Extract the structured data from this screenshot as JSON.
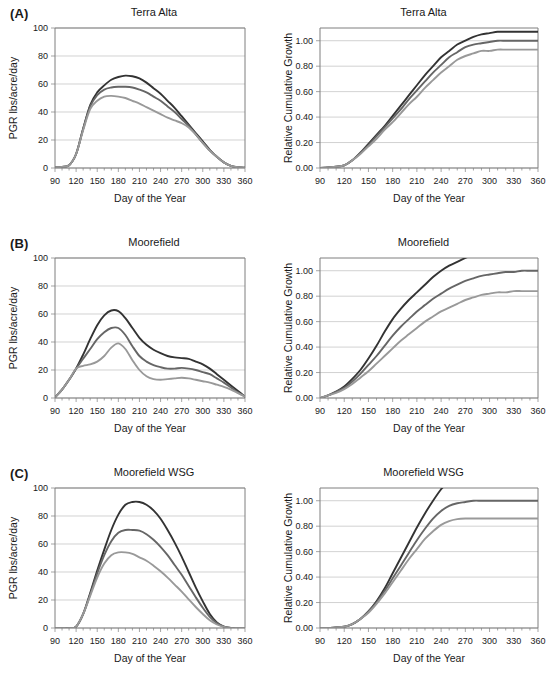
{
  "figure": {
    "panels": [
      {
        "tag": "(A)",
        "location": "Terra Alta",
        "left_title": "Terra Alta",
        "right_title": "Terra Alta"
      },
      {
        "tag": "(B)",
        "location": "Moorefield",
        "left_title": "Moorefield",
        "right_title": "Moorefield"
      },
      {
        "tag": "(C)",
        "location": "Moorefield WSG",
        "left_title": "Moorefield WSG",
        "right_title": "Moorefield WSG"
      }
    ]
  },
  "axes": {
    "x_label": "Day of the Year",
    "x_ticks": [
      90,
      120,
      150,
      180,
      210,
      240,
      270,
      300,
      330,
      360
    ],
    "x_range": [
      90,
      360
    ],
    "pgr_label": "PGR lbs/acre/day",
    "pgr_ticks": [
      0,
      20,
      40,
      60,
      80,
      100
    ],
    "pgr_range": [
      0,
      100
    ],
    "rcg_label": "Relative Cumulative Growth",
    "rcg_ticks": [
      "0.00",
      "0.20",
      "0.40",
      "0.60",
      "0.80",
      "1.00"
    ],
    "rcg_tick_values": [
      0,
      0.2,
      0.4,
      0.6,
      0.8,
      1.0
    ],
    "rcg_range": [
      0,
      1.1
    ]
  },
  "colors": {
    "series_dark": "#333333",
    "series_medium": "#666666",
    "series_light": "#999999",
    "axis": "#7f7f7f",
    "grid": "#bfbfbf",
    "text": "#1a1a1a",
    "background": "#ffffff"
  },
  "chart_data": [
    {
      "id": "a-left",
      "type": "line",
      "title": "Terra Alta",
      "xlabel": "Day of the Year",
      "ylabel": "PGR lbs/acre/day",
      "xlim": [
        90,
        360
      ],
      "ylim": [
        0,
        100
      ],
      "grid": true,
      "legend": "none",
      "x": [
        90,
        100,
        110,
        120,
        130,
        140,
        150,
        160,
        170,
        180,
        190,
        200,
        210,
        220,
        230,
        240,
        250,
        260,
        270,
        280,
        290,
        300,
        310,
        320,
        330,
        340,
        350,
        360
      ],
      "series": [
        {
          "name": "high",
          "color": "#333333",
          "values": [
            0.5,
            0.8,
            2,
            10,
            28,
            45,
            54,
            59,
            63,
            65,
            66,
            65.5,
            64,
            61,
            57,
            53,
            48,
            43,
            37,
            31,
            25,
            19,
            13,
            8,
            4,
            1.5,
            0.5,
            0.2
          ]
        },
        {
          "name": "medium",
          "color": "#666666",
          "values": [
            0.5,
            0.8,
            2,
            10,
            28,
            44,
            52,
            56,
            57.5,
            58,
            58,
            57.5,
            56,
            54,
            51,
            48,
            44,
            40,
            35,
            30,
            24,
            18,
            12.5,
            8,
            4,
            1.5,
            0.5,
            0.2
          ]
        },
        {
          "name": "low",
          "color": "#999999",
          "values": [
            0.5,
            0.8,
            2,
            10,
            27,
            42,
            48,
            51,
            51.5,
            51,
            50,
            48,
            46,
            43.5,
            41,
            38.5,
            36,
            34,
            32,
            29,
            24,
            18,
            12.5,
            8,
            4,
            1.5,
            0.5,
            0.2
          ]
        }
      ]
    },
    {
      "id": "a-right",
      "type": "line",
      "title": "Terra Alta",
      "xlabel": "Day of the Year",
      "ylabel": "Relative Cumulative Growth",
      "xlim": [
        90,
        360
      ],
      "ylim": [
        0,
        1.1
      ],
      "grid": true,
      "legend": "none",
      "x": [
        90,
        100,
        110,
        120,
        130,
        140,
        150,
        160,
        170,
        180,
        190,
        200,
        210,
        220,
        230,
        240,
        250,
        260,
        270,
        280,
        290,
        300,
        310,
        320,
        330,
        340,
        350,
        360
      ],
      "series": [
        {
          "name": "high",
          "color": "#333333",
          "values": [
            0.0,
            0.005,
            0.01,
            0.02,
            0.06,
            0.12,
            0.19,
            0.26,
            0.33,
            0.41,
            0.49,
            0.57,
            0.65,
            0.73,
            0.8,
            0.87,
            0.92,
            0.97,
            1.0,
            1.03,
            1.05,
            1.06,
            1.07,
            1.07,
            1.07,
            1.07,
            1.07,
            1.07
          ]
        },
        {
          "name": "medium",
          "color": "#666666",
          "values": [
            0.0,
            0.005,
            0.01,
            0.02,
            0.06,
            0.12,
            0.18,
            0.25,
            0.32,
            0.39,
            0.46,
            0.54,
            0.61,
            0.68,
            0.75,
            0.81,
            0.87,
            0.91,
            0.95,
            0.97,
            0.98,
            0.99,
            1.0,
            1.0,
            1.0,
            1.0,
            1.0,
            1.0
          ]
        },
        {
          "name": "low",
          "color": "#999999",
          "values": [
            0.0,
            0.005,
            0.01,
            0.02,
            0.06,
            0.11,
            0.17,
            0.23,
            0.3,
            0.36,
            0.43,
            0.5,
            0.56,
            0.63,
            0.69,
            0.75,
            0.8,
            0.85,
            0.88,
            0.9,
            0.92,
            0.92,
            0.93,
            0.93,
            0.93,
            0.93,
            0.93,
            0.93
          ]
        }
      ]
    },
    {
      "id": "b-left",
      "type": "line",
      "title": "Moorefield",
      "xlabel": "Day of the Year",
      "ylabel": "PGR lbs/acre/day",
      "xlim": [
        90,
        360
      ],
      "ylim": [
        0,
        100
      ],
      "grid": true,
      "legend": "none",
      "x": [
        90,
        100,
        110,
        120,
        130,
        140,
        150,
        160,
        170,
        180,
        190,
        200,
        210,
        220,
        230,
        240,
        250,
        260,
        270,
        280,
        290,
        300,
        310,
        320,
        330,
        340,
        350,
        360
      ],
      "series": [
        {
          "name": "high",
          "color": "#333333",
          "values": [
            0.5,
            6,
            13,
            21,
            31,
            42,
            52,
            59,
            62.5,
            62,
            57,
            50,
            43,
            38,
            34.5,
            32,
            30,
            29,
            28.5,
            28,
            26,
            24,
            21,
            17,
            13,
            9,
            5,
            1
          ]
        },
        {
          "name": "medium",
          "color": "#666666",
          "values": [
            0.5,
            6,
            13,
            21,
            28,
            35,
            42,
            47,
            50,
            50,
            45,
            37,
            30,
            26,
            23.5,
            22,
            21,
            21,
            21.5,
            21,
            20,
            18.5,
            17,
            14,
            11,
            7.5,
            4,
            1
          ]
        },
        {
          "name": "low",
          "color": "#999999",
          "values": [
            0.5,
            6,
            13,
            21,
            23,
            24,
            26,
            30,
            36,
            39,
            35,
            27,
            20,
            15.5,
            13.5,
            13,
            13.5,
            14,
            14.5,
            14,
            13,
            12,
            11,
            9.5,
            8,
            6,
            3.5,
            1
          ]
        }
      ]
    },
    {
      "id": "b-right",
      "type": "line",
      "title": "Moorefield",
      "xlabel": "Day of the Year",
      "ylabel": "Relative Cumulative Growth",
      "xlim": [
        90,
        360
      ],
      "ylim": [
        0,
        1.1
      ],
      "grid": true,
      "legend": "none",
      "x": [
        90,
        100,
        110,
        120,
        130,
        140,
        150,
        160,
        170,
        180,
        190,
        200,
        210,
        220,
        230,
        240,
        250,
        260,
        270,
        280,
        290,
        300,
        310,
        320,
        330,
        340,
        350,
        360
      ],
      "series": [
        {
          "name": "high",
          "color": "#333333",
          "values": [
            0.0,
            0.02,
            0.05,
            0.09,
            0.15,
            0.22,
            0.31,
            0.41,
            0.52,
            0.62,
            0.7,
            0.77,
            0.83,
            0.89,
            0.95,
            1.0,
            1.04,
            1.07,
            1.1,
            1.13,
            1.16,
            1.18,
            1.19,
            1.2,
            1.2,
            1.2,
            1.2,
            1.2
          ]
        },
        {
          "name": "medium",
          "color": "#666666",
          "values": [
            0.0,
            0.02,
            0.05,
            0.08,
            0.13,
            0.19,
            0.26,
            0.33,
            0.41,
            0.49,
            0.56,
            0.62,
            0.68,
            0.73,
            0.78,
            0.82,
            0.86,
            0.89,
            0.92,
            0.94,
            0.96,
            0.97,
            0.98,
            0.99,
            0.99,
            1.0,
            1.0,
            1.0
          ]
        },
        {
          "name": "low",
          "color": "#999999",
          "values": [
            0.0,
            0.02,
            0.04,
            0.07,
            0.11,
            0.16,
            0.21,
            0.27,
            0.33,
            0.39,
            0.45,
            0.5,
            0.55,
            0.6,
            0.64,
            0.68,
            0.71,
            0.74,
            0.77,
            0.79,
            0.81,
            0.82,
            0.83,
            0.83,
            0.84,
            0.84,
            0.84,
            0.84
          ]
        }
      ]
    },
    {
      "id": "c-left",
      "type": "line",
      "title": "Moorefield WSG",
      "xlabel": "Day of the Year",
      "ylabel": "PGR lbs/acre/day",
      "xlim": [
        90,
        360
      ],
      "ylim": [
        0,
        100
      ],
      "grid": true,
      "legend": "none",
      "x": [
        90,
        100,
        110,
        120,
        130,
        140,
        150,
        160,
        170,
        180,
        190,
        200,
        210,
        220,
        230,
        240,
        250,
        260,
        270,
        280,
        290,
        300,
        310,
        320,
        330,
        340,
        350,
        360
      ],
      "series": [
        {
          "name": "high",
          "color": "#333333",
          "values": [
            0,
            0,
            0,
            1,
            10,
            25,
            41,
            56,
            70,
            81,
            88,
            90,
            90,
            88,
            84,
            78,
            70,
            61,
            51,
            40,
            29,
            19,
            10,
            4,
            1,
            0,
            0,
            0
          ]
        },
        {
          "name": "medium",
          "color": "#666666",
          "values": [
            0,
            0,
            0,
            1,
            10,
            24,
            39,
            52,
            62,
            68,
            70,
            70,
            69.5,
            67,
            63,
            58,
            52,
            45,
            38,
            30,
            22,
            14.5,
            8,
            3.5,
            1,
            0,
            0,
            0
          ]
        },
        {
          "name": "low",
          "color": "#999999",
          "values": [
            0,
            0,
            0,
            1,
            10,
            23,
            36,
            46,
            52,
            54,
            54,
            53,
            50.5,
            48,
            44.5,
            40.5,
            36,
            31,
            26,
            20.5,
            15,
            10,
            5.5,
            2.5,
            0.8,
            0,
            0,
            0
          ]
        }
      ]
    },
    {
      "id": "c-right",
      "type": "line",
      "title": "Moorefield WSG",
      "xlabel": "Day of the Year",
      "ylabel": "Relative Cumulative Growth",
      "xlim": [
        90,
        360
      ],
      "ylim": [
        0,
        1.1
      ],
      "grid": true,
      "legend": "none",
      "x": [
        90,
        100,
        110,
        120,
        130,
        140,
        150,
        160,
        170,
        180,
        190,
        200,
        210,
        220,
        230,
        240,
        250,
        260,
        270,
        280,
        290,
        300,
        310,
        320,
        330,
        340,
        350,
        360
      ],
      "series": [
        {
          "name": "high",
          "color": "#333333",
          "values": [
            0.0,
            0.0,
            0.005,
            0.01,
            0.03,
            0.07,
            0.13,
            0.21,
            0.31,
            0.43,
            0.55,
            0.67,
            0.79,
            0.9,
            1.0,
            1.09,
            1.16,
            1.22,
            1.26,
            1.29,
            1.31,
            1.32,
            1.32,
            1.32,
            1.32,
            1.32,
            1.32,
            1.32
          ]
        },
        {
          "name": "medium",
          "color": "#666666",
          "values": [
            0.0,
            0.0,
            0.005,
            0.01,
            0.03,
            0.07,
            0.13,
            0.2,
            0.29,
            0.39,
            0.49,
            0.59,
            0.69,
            0.78,
            0.86,
            0.92,
            0.96,
            0.98,
            0.99,
            1.0,
            1.0,
            1.0,
            1.0,
            1.0,
            1.0,
            1.0,
            1.0,
            1.0
          ]
        },
        {
          "name": "low",
          "color": "#999999",
          "values": [
            0.0,
            0.0,
            0.005,
            0.01,
            0.03,
            0.07,
            0.12,
            0.19,
            0.27,
            0.36,
            0.45,
            0.54,
            0.62,
            0.7,
            0.76,
            0.81,
            0.84,
            0.855,
            0.86,
            0.86,
            0.86,
            0.86,
            0.86,
            0.86,
            0.86,
            0.86,
            0.86,
            0.86
          ]
        }
      ]
    }
  ]
}
